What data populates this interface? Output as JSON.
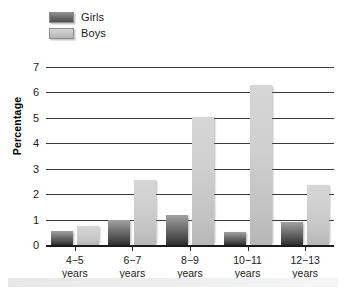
{
  "chart_data": {
    "type": "bar",
    "title": "",
    "xlabel": "",
    "ylabel": "Percentage",
    "ylim": [
      0,
      7
    ],
    "yticks": [
      0,
      1,
      2,
      3,
      4,
      5,
      6,
      7
    ],
    "grid": true,
    "legend_position": "top-left",
    "categories": [
      "4−5\nyears",
      "6−7\nyears",
      "8−9\nyears",
      "10−11\nyears",
      "12−13\nyears"
    ],
    "category_lines": [
      {
        "range": "4−5",
        "unit": "years"
      },
      {
        "range": "6−7",
        "unit": "years"
      },
      {
        "range": "8−9",
        "unit": "years"
      },
      {
        "range": "10−11",
        "unit": "years"
      },
      {
        "range": "12−13",
        "unit": "years"
      }
    ],
    "series": [
      {
        "name": "Girls",
        "color": "#6e6e6e",
        "values": [
          0.55,
          1.0,
          1.2,
          0.5,
          0.9
        ]
      },
      {
        "name": "Boys",
        "color": "#c6c6c6",
        "values": [
          0.75,
          2.55,
          5.05,
          6.3,
          2.35
        ]
      }
    ]
  },
  "legend": {
    "items": [
      {
        "label": "Girls",
        "swatch": "girls-swatch"
      },
      {
        "label": "Boys",
        "swatch": "boys-swatch"
      }
    ]
  },
  "axis": {
    "y_title": "Percentage",
    "y_tick_labels": [
      "7",
      "6",
      "5",
      "4",
      "3",
      "2",
      "1",
      "0"
    ]
  }
}
